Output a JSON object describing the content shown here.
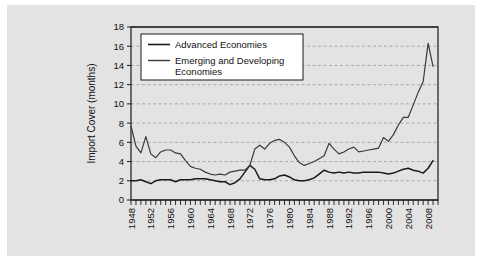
{
  "figure": {
    "background_color": "#ffffff",
    "plate_color": "#e3e3e3",
    "plot_background_color": "#ffffff",
    "axis_color": "#1a1a1a",
    "grid_color": "#9a9a9a"
  },
  "axes": {
    "ylabel": "Import Cover (months)",
    "xlabel": "",
    "ytick_labels": [
      "0",
      "2",
      "4",
      "6",
      "8",
      "10",
      "12",
      "14",
      "16",
      "18"
    ],
    "xtick_labels": [
      "1948",
      "1952",
      "1956",
      "1960",
      "1964",
      "1968",
      "1972",
      "1976",
      "1980",
      "1984",
      "1988",
      "1992",
      "1996",
      "2000",
      "2004",
      "2008"
    ]
  },
  "legend": {
    "entries": [
      {
        "label": "Advanced Economies",
        "color": "#1a1a1a"
      },
      {
        "label": "Emerging and Developing Economies",
        "color": "#3a3a3a"
      }
    ]
  },
  "chart_data": {
    "type": "line",
    "title": "",
    "xlabel": "",
    "ylabel": "Import Cover (months)",
    "xlim": [
      1948,
      2010
    ],
    "ylim": [
      0,
      18
    ],
    "ytick_step": 2,
    "grid": true,
    "grid_axis": "y",
    "grid_style": "dashed",
    "legend_position": "upper-left-inside",
    "x": [
      1948,
      1949,
      1950,
      1951,
      1952,
      1953,
      1954,
      1955,
      1956,
      1957,
      1958,
      1959,
      1960,
      1961,
      1962,
      1963,
      1964,
      1965,
      1966,
      1967,
      1968,
      1969,
      1970,
      1971,
      1972,
      1973,
      1974,
      1975,
      1976,
      1977,
      1978,
      1979,
      1980,
      1981,
      1982,
      1983,
      1984,
      1985,
      1986,
      1987,
      1988,
      1989,
      1990,
      1991,
      1992,
      1993,
      1994,
      1995,
      1996,
      1997,
      1998,
      1999,
      2000,
      2001,
      2002,
      2003,
      2004,
      2005,
      2006,
      2007,
      2008,
      2009
    ],
    "series": [
      {
        "name": "Advanced Economies",
        "color": "#1a1a1a",
        "values": [
          2.0,
          2.0,
          2.1,
          1.9,
          1.7,
          2.0,
          2.1,
          2.1,
          2.1,
          1.9,
          2.1,
          2.1,
          2.1,
          2.2,
          2.2,
          2.2,
          2.1,
          2.0,
          1.9,
          1.9,
          1.6,
          1.8,
          2.2,
          2.9,
          3.6,
          3.2,
          2.2,
          2.1,
          2.1,
          2.2,
          2.5,
          2.6,
          2.4,
          2.1,
          2.0,
          2.0,
          2.1,
          2.3,
          2.7,
          3.1,
          2.9,
          2.8,
          2.9,
          2.8,
          2.9,
          2.8,
          2.8,
          2.9,
          2.9,
          2.9,
          2.9,
          2.8,
          2.7,
          2.8,
          3.0,
          3.2,
          3.3,
          3.1,
          3.0,
          2.8,
          3.3,
          4.1
        ]
      },
      {
        "name": "Emerging and Developing Economies",
        "color": "#3a3a3a",
        "values": [
          7.7,
          5.6,
          4.9,
          6.6,
          4.8,
          4.4,
          5.0,
          5.2,
          5.2,
          4.9,
          4.8,
          4.1,
          3.5,
          3.3,
          3.2,
          2.9,
          2.7,
          2.6,
          2.7,
          2.6,
          2.9,
          3.0,
          3.1,
          3.1,
          3.6,
          5.3,
          5.7,
          5.3,
          5.9,
          6.2,
          6.3,
          6.0,
          5.5,
          4.6,
          3.9,
          3.6,
          3.8,
          4.0,
          4.3,
          4.6,
          5.9,
          5.3,
          4.8,
          5.0,
          5.3,
          5.5,
          5.0,
          5.1,
          5.2,
          5.3,
          5.4,
          6.5,
          6.1,
          6.8,
          7.8,
          8.6,
          8.6,
          9.9,
          11.2,
          12.3,
          16.3,
          13.9
        ]
      }
    ]
  }
}
